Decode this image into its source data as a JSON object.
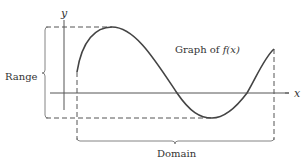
{
  "diagram": {
    "title": "Graph of f(x)",
    "curve_label_prefix": "Graph of ",
    "curve_label_func": "f(x)",
    "x_axis_label": "x",
    "y_axis_label": "y",
    "range_label": "Range",
    "domain_label": "Domain",
    "colors": {
      "axis": "#555555",
      "curve": "#444444",
      "dashed": "#555555",
      "bracket": "#777777",
      "text": "#333333"
    }
  }
}
